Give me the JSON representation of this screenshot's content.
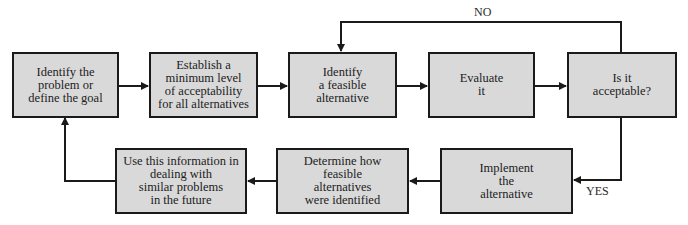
{
  "diagram": {
    "colors": {
      "box_fill": "#d9d9d9",
      "box_border": "#1a1a1a",
      "line": "#1a1a1a"
    },
    "nodes": [
      {
        "id": "identify-problem",
        "text": "Identify the\nproblem or\ndefine the goal"
      },
      {
        "id": "establish-minimum",
        "text": "Establish a\nminimum level\nof acceptability\nfor all alternatives"
      },
      {
        "id": "identify-alternative",
        "text": "Identify\na feasible\nalternative"
      },
      {
        "id": "evaluate",
        "text": "Evaluate\nit"
      },
      {
        "id": "is-acceptable",
        "text": "Is it\nacceptable?"
      },
      {
        "id": "implement",
        "text": "Implement\nthe\nalternative"
      },
      {
        "id": "determine-how",
        "text": "Determine how\nfeasible\nalternatives\nwere identified"
      },
      {
        "id": "use-information",
        "text": "Use this information in\ndealing with\nsimilar problems\nin the future"
      }
    ],
    "edges": [
      {
        "from": "identify-problem",
        "to": "establish-minimum",
        "label": ""
      },
      {
        "from": "establish-minimum",
        "to": "identify-alternative",
        "label": ""
      },
      {
        "from": "identify-alternative",
        "to": "evaluate",
        "label": ""
      },
      {
        "from": "evaluate",
        "to": "is-acceptable",
        "label": ""
      },
      {
        "from": "is-acceptable",
        "to": "identify-alternative",
        "label": "NO"
      },
      {
        "from": "is-acceptable",
        "to": "implement",
        "label": "YES"
      },
      {
        "from": "implement",
        "to": "determine-how",
        "label": ""
      },
      {
        "from": "determine-how",
        "to": "use-information",
        "label": ""
      },
      {
        "from": "use-information",
        "to": "identify-problem",
        "label": ""
      }
    ],
    "labels": {
      "no": "NO",
      "yes": "YES"
    }
  }
}
